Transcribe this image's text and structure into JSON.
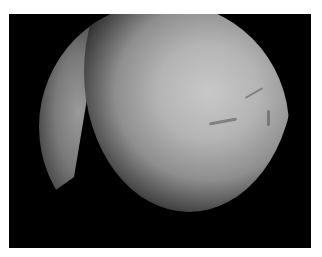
{
  "image": {
    "description": "Grayscale arthroscopic/endoscopic view: circular field of view on a black background with a thin white border; a bright curved sliver on the left and a large lit tissue dome on the right with faint vessel markings.",
    "colors": {
      "border": "#ffffff",
      "background": "#000000",
      "tissue_highlight": "#c8c8c8",
      "tissue_mid": "#8e8e8e"
    }
  }
}
